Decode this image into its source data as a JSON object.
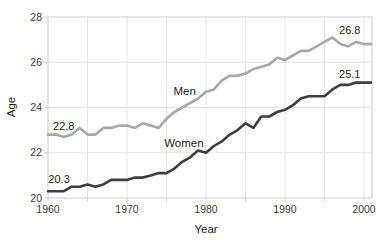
{
  "chart_data": {
    "type": "line",
    "title": "",
    "xlabel": "Year",
    "ylabel": "Age",
    "xlim": [
      1960,
      2001
    ],
    "ylim": [
      20,
      28
    ],
    "grid": true,
    "x": [
      1960,
      1961,
      1962,
      1963,
      1964,
      1965,
      1966,
      1967,
      1968,
      1969,
      1970,
      1971,
      1972,
      1973,
      1974,
      1975,
      1976,
      1977,
      1978,
      1979,
      1980,
      1981,
      1982,
      1983,
      1984,
      1985,
      1986,
      1987,
      1988,
      1989,
      1990,
      1991,
      1992,
      1993,
      1994,
      1995,
      1996,
      1997,
      1998,
      1999,
      2000
    ],
    "series": [
      {
        "name": "Men",
        "color": "#a8a8a8",
        "values": [
          22.8,
          22.8,
          22.7,
          22.8,
          23.1,
          22.8,
          22.8,
          23.1,
          23.1,
          23.2,
          23.2,
          23.1,
          23.3,
          23.2,
          23.1,
          23.5,
          23.8,
          24.0,
          24.2,
          24.4,
          24.7,
          24.8,
          25.2,
          25.4,
          25.4,
          25.5,
          25.7,
          25.8,
          25.9,
          26.2,
          26.1,
          26.3,
          26.5,
          26.5,
          26.7,
          26.9,
          27.1,
          26.8,
          26.7,
          26.9,
          26.8
        ]
      },
      {
        "name": "Women",
        "color": "#3e3e3e",
        "values": [
          20.3,
          20.3,
          20.3,
          20.5,
          20.5,
          20.6,
          20.5,
          20.6,
          20.8,
          20.8,
          20.8,
          20.9,
          20.9,
          21.0,
          21.1,
          21.1,
          21.3,
          21.6,
          21.8,
          22.1,
          22.0,
          22.3,
          22.5,
          22.8,
          23.0,
          23.3,
          23.1,
          23.6,
          23.6,
          23.8,
          23.9,
          24.1,
          24.4,
          24.5,
          24.5,
          24.5,
          24.8,
          25.0,
          25.0,
          25.1,
          25.1
        ]
      }
    ],
    "x_ticks": [
      1960,
      1970,
      1980,
      1990,
      2000
    ],
    "y_ticks": [
      20,
      22,
      24,
      26,
      28
    ],
    "x_tick_marks": [
      1960,
      1965,
      1970,
      1975,
      1980,
      1985,
      1990,
      1995,
      2000
    ],
    "x_gridlines": [
      1965,
      1970,
      1975,
      1980,
      1985,
      1990,
      1995,
      2000
    ],
    "y_gridlines": [
      22,
      24,
      26
    ],
    "annotations": [
      {
        "text": "22.8",
        "year": 1962.0,
        "age": 23.15,
        "name": "point-label-men-start",
        "cls": "ann"
      },
      {
        "text": "20.3",
        "year": 1961.4,
        "age": 20.8,
        "name": "point-label-women-start",
        "cls": "ann"
      },
      {
        "text": "26.8",
        "year": 1998.2,
        "age": 27.4,
        "name": "point-label-men-end",
        "cls": "ann"
      },
      {
        "text": "25.1",
        "year": 1998.2,
        "age": 25.45,
        "name": "point-label-women-end",
        "cls": "ann"
      },
      {
        "text": "Men",
        "year": 1977.3,
        "age": 24.7,
        "name": "series-label-men",
        "cls": "series-ann"
      },
      {
        "text": "Women",
        "year": 1977.2,
        "age": 22.4,
        "name": "series-label-women",
        "cls": "series-ann"
      }
    ],
    "colors": {
      "gridline": "#e4e4e4",
      "frame": "#cccccc",
      "text": "#1c1c1c"
    }
  }
}
